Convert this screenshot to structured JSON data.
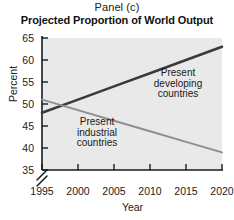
{
  "panel": {
    "label": "Panel (c)"
  },
  "chart_data": {
    "type": "line",
    "title": "Projected Proportion of World Output",
    "subtitle": "Panel (c)",
    "xlabel": "Year",
    "ylabel": "Percent",
    "xlim": [
      1995,
      2020
    ],
    "ylim": [
      35,
      65
    ],
    "xticks": [
      1995,
      2000,
      2005,
      2010,
      2015,
      2020
    ],
    "yticks": [
      35,
      40,
      45,
      50,
      55,
      60,
      65
    ],
    "grid": false,
    "legend_position": "inline-annotations",
    "y_axis_break": true,
    "x": [
      1995,
      2000,
      2005,
      2010,
      2015,
      2020
    ],
    "series": [
      {
        "name": "Present developing countries",
        "values": [
          48,
          51,
          54,
          57,
          60,
          63
        ],
        "color": "#3a3a3a",
        "width": 2.6
      },
      {
        "name": "Present industrial countries",
        "values": [
          51,
          48.6,
          46.2,
          43.8,
          41.4,
          39
        ],
        "color": "#8f8f8f",
        "width": 2.0
      }
    ],
    "annotations": [
      {
        "id": "developing",
        "text": "Present\ndeveloping\ncountries",
        "line1": "Present",
        "line2": "developing",
        "line3": "countries"
      },
      {
        "id": "industrial",
        "text": "Present\nindustrial\ncountries",
        "line1": "Present",
        "line2": "industrial",
        "line3": "countries"
      }
    ],
    "plot_background": "#e9e9e9",
    "axis_color": "#1a1a1a"
  }
}
